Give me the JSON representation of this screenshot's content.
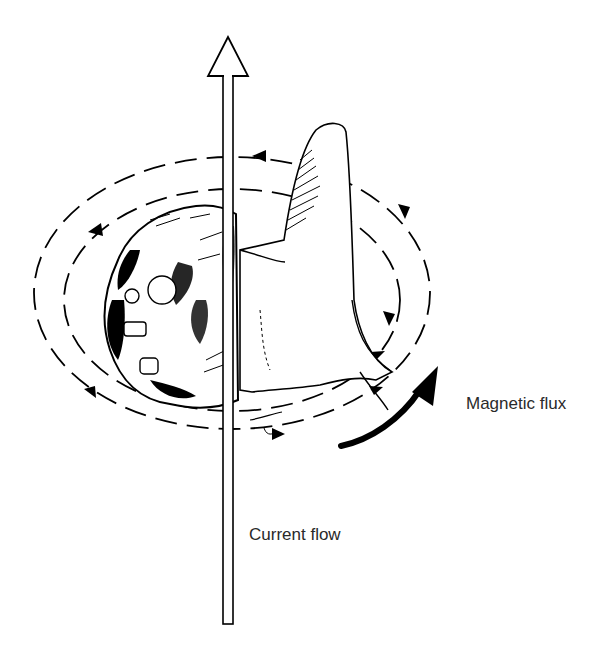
{
  "diagram": {
    "type": "right-hand-rule",
    "labels": {
      "magnetic_flux": "Magnetic flux",
      "current_flow": "Current flow"
    },
    "elements": [
      {
        "name": "current-arrow",
        "direction": "up",
        "description": "Hollow vertical arrow through the fist"
      },
      {
        "name": "hand",
        "description": "Right hand with thumb pointing up, fingers curled"
      },
      {
        "name": "flux-loops",
        "description": "Dashed elliptical loops with arrowheads circling counterclockwise (viewed from above)"
      },
      {
        "name": "flux-direction-arrow",
        "description": "Bold curved arrow indicating flux direction"
      }
    ],
    "colors": {
      "ink": "#000000",
      "background": "#ffffff",
      "text": "#2a2a2a"
    }
  }
}
